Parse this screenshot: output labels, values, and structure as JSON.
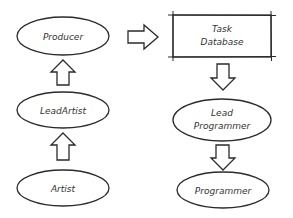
{
  "diagram": {
    "type": "flow",
    "nodes": [
      {
        "id": "producer",
        "label": "Producer",
        "shape": "ellipse"
      },
      {
        "id": "lead_artist",
        "label": "LeadArtist",
        "shape": "ellipse"
      },
      {
        "id": "artist",
        "label": "Artist",
        "shape": "ellipse"
      },
      {
        "id": "task_database",
        "label_line1": "Task",
        "label_line2": "Database",
        "shape": "rectangle"
      },
      {
        "id": "lead_programmer",
        "label_line1": "Lead",
        "label_line2": "Programmer",
        "shape": "ellipse"
      },
      {
        "id": "programmer",
        "label": "Programmer",
        "shape": "ellipse"
      }
    ],
    "edges": [
      {
        "from": "artist",
        "to": "lead_artist",
        "direction": "up"
      },
      {
        "from": "lead_artist",
        "to": "producer",
        "direction": "up"
      },
      {
        "from": "producer",
        "to": "task_database",
        "direction": "right"
      },
      {
        "from": "task_database",
        "to": "lead_programmer",
        "direction": "down"
      },
      {
        "from": "lead_programmer",
        "to": "programmer",
        "direction": "down"
      }
    ],
    "colors": {
      "stroke": "#2a2a2a",
      "text": "#333333",
      "background": "#ffffff"
    }
  }
}
